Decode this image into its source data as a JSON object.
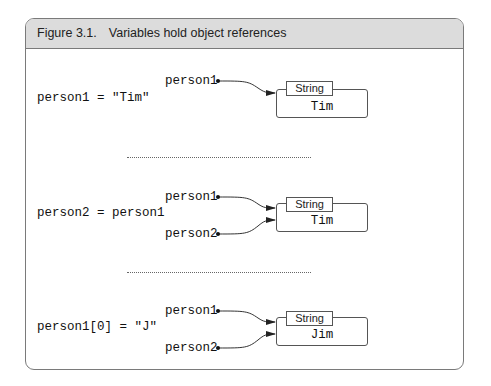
{
  "figure": {
    "number": "Figure 3.1.",
    "title": "Variables hold object references"
  },
  "panels": [
    {
      "statement": "person1 = \"Tim\"",
      "variables": [
        "person1"
      ],
      "object": {
        "type": "String",
        "value": "Tim"
      }
    },
    {
      "statement": "person2 = person1",
      "variables": [
        "person1",
        "person2"
      ],
      "object": {
        "type": "String",
        "value": "Tim"
      }
    },
    {
      "statement": "person1[0] = \"J\"",
      "variables": [
        "person1",
        "person2"
      ],
      "object": {
        "type": "String",
        "value": "Jim"
      }
    }
  ],
  "colors": {
    "frame_border": "#7a7a7a",
    "header_bg": "#dcdcdc",
    "line": "#333333"
  }
}
